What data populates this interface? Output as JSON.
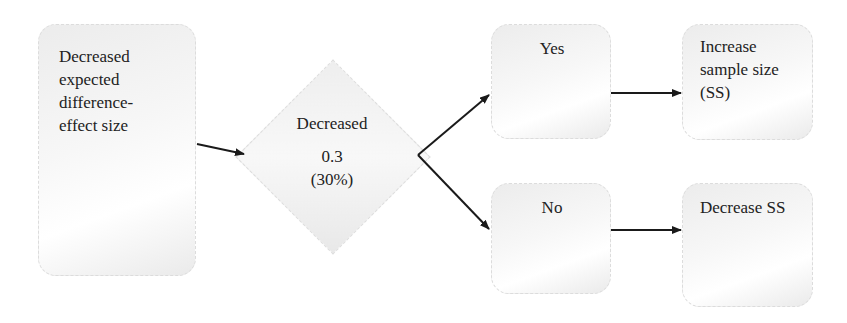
{
  "diagram": {
    "type": "flowchart",
    "nodes": {
      "start": {
        "label_lines": [
          "Decreased",
          "expected",
          "difference-",
          "effect size"
        ]
      },
      "decision": {
        "title": "Decreased",
        "value": "0.3",
        "percent": "(30%)"
      },
      "yes": {
        "label": "Yes"
      },
      "no": {
        "label": "No"
      },
      "increase": {
        "label_lines": [
          "Increase",
          "sample size",
          "(SS)"
        ]
      },
      "decrease": {
        "label": "Decrease SS"
      }
    },
    "edges": [
      {
        "from": "start",
        "to": "decision"
      },
      {
        "from": "decision",
        "to": "yes"
      },
      {
        "from": "decision",
        "to": "no"
      },
      {
        "from": "yes",
        "to": "increase"
      },
      {
        "from": "no",
        "to": "decrease"
      }
    ],
    "colors": {
      "box_fill": "#f2f2f2",
      "arrow": "#1a1a1a",
      "text": "#222222"
    }
  }
}
